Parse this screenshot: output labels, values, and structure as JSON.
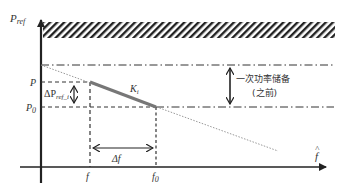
{
  "diagram": {
    "type": "droop-control-diagram",
    "y_axis_label": "P",
    "y_axis_label_sub": "ref",
    "x_axis_label": "f",
    "x_axis_label_hat": "^",
    "levels": {
      "P": "P",
      "P0": "P",
      "P0_sub": "0"
    },
    "freqs": {
      "f": "f",
      "f0": "f",
      "f0_sub": "0"
    },
    "slope_label": "K",
    "slope_label_sub": "i",
    "delta_p_label": "ΔP",
    "delta_p_sub": "ref_i",
    "delta_f_label": "Δf",
    "reserve_label_line1": "一次功率储备",
    "reserve_label_line2": "(之前)",
    "colors": {
      "axis": "#222222",
      "hatch": "#222222",
      "droop_line": "#777777",
      "dotted_line": "#888888",
      "text": "#333333"
    }
  }
}
